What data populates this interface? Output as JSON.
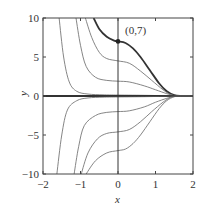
{
  "chart_data": {
    "type": "line",
    "title": "",
    "xlabel": "x",
    "ylabel": "y",
    "xlim": [
      -2,
      2
    ],
    "ylim": [
      -10,
      10
    ],
    "grid": false,
    "x_ticks": [
      "-2",
      "-1",
      "0",
      "1",
      "2"
    ],
    "y_ticks": [
      "10",
      "5",
      "0",
      "-5",
      "-10"
    ],
    "x_tick_values": [
      -2,
      -1,
      0,
      1,
      2
    ],
    "y_tick_values": [
      10,
      5,
      0,
      -5,
      -10
    ],
    "annotation": {
      "label": "(0,7)",
      "x": 0,
      "y": 7
    },
    "series": [
      {
        "name": "y(0)=7",
        "bold": true,
        "points": [
          [
            -0.65,
            10
          ],
          [
            -0.5,
            8.6
          ],
          [
            -0.3,
            7.6
          ],
          [
            -0.1,
            7.1
          ],
          [
            0,
            7
          ],
          [
            0.2,
            6.8
          ],
          [
            0.4,
            6.1
          ],
          [
            0.6,
            5
          ],
          [
            0.85,
            3.3
          ],
          [
            1.1,
            1.6
          ],
          [
            1.3,
            0.6
          ],
          [
            1.5,
            0.1
          ],
          [
            1.7,
            0
          ],
          [
            2,
            0
          ]
        ]
      },
      {
        "name": "y(0)=4.5",
        "bold": false,
        "points": [
          [
            -0.87,
            10
          ],
          [
            -0.7,
            7.5
          ],
          [
            -0.5,
            5.6
          ],
          [
            -0.3,
            4.8
          ],
          [
            0,
            4.5
          ],
          [
            0.3,
            4.2
          ],
          [
            0.6,
            3.2
          ],
          [
            0.9,
            2
          ],
          [
            1.2,
            0.8
          ],
          [
            1.4,
            0.2
          ],
          [
            1.6,
            0
          ],
          [
            2,
            0
          ]
        ]
      },
      {
        "name": "y(0)=1.9",
        "bold": false,
        "points": [
          [
            -1.12,
            10
          ],
          [
            -1.0,
            6.5
          ],
          [
            -0.85,
            3.8
          ],
          [
            -0.6,
            2.4
          ],
          [
            -0.3,
            2.0
          ],
          [
            0,
            1.9
          ],
          [
            0.3,
            1.8
          ],
          [
            0.7,
            1.3
          ],
          [
            1.0,
            0.8
          ],
          [
            1.3,
            0.3
          ],
          [
            1.5,
            0.05
          ],
          [
            1.7,
            0
          ],
          [
            2,
            0
          ]
        ]
      },
      {
        "name": "y(0)=0.2",
        "bold": false,
        "points": [
          [
            -1.57,
            10
          ],
          [
            -1.45,
            5
          ],
          [
            -1.3,
            1.8
          ],
          [
            -1.1,
            0.6
          ],
          [
            -0.8,
            0.25
          ],
          [
            -0.4,
            0.15
          ],
          [
            0,
            0.12
          ],
          [
            0.8,
            0.08
          ],
          [
            1.4,
            0.02
          ],
          [
            2,
            0
          ]
        ]
      },
      {
        "name": "y(0)=0",
        "bold": true,
        "points": [
          [
            -2,
            0
          ],
          [
            2,
            0
          ]
        ]
      },
      {
        "name": "y(0)=-0.2",
        "bold": false,
        "points": [
          [
            -1.63,
            -10
          ],
          [
            -1.5,
            -5
          ],
          [
            -1.35,
            -1.8
          ],
          [
            -1.1,
            -0.6
          ],
          [
            -0.8,
            -0.25
          ],
          [
            -0.4,
            -0.15
          ],
          [
            0,
            -0.12
          ],
          [
            0.8,
            -0.08
          ],
          [
            1.4,
            -0.02
          ],
          [
            2,
            0
          ]
        ]
      },
      {
        "name": "y(0)=-2",
        "bold": false,
        "points": [
          [
            -1.17,
            -10
          ],
          [
            -1.05,
            -6.5
          ],
          [
            -0.9,
            -3.8
          ],
          [
            -0.6,
            -2.5
          ],
          [
            -0.3,
            -2.1
          ],
          [
            0,
            -2
          ],
          [
            0.3,
            -1.9
          ],
          [
            0.7,
            -1.4
          ],
          [
            1.0,
            -0.8
          ],
          [
            1.3,
            -0.3
          ],
          [
            1.5,
            -0.05
          ],
          [
            1.7,
            0
          ],
          [
            2,
            0
          ]
        ]
      },
      {
        "name": "y(0)=-4.6",
        "bold": false,
        "points": [
          [
            -0.98,
            -10
          ],
          [
            -0.8,
            -7.3
          ],
          [
            -0.55,
            -5.5
          ],
          [
            -0.3,
            -4.8
          ],
          [
            0,
            -4.6
          ],
          [
            0.3,
            -4.3
          ],
          [
            0.6,
            -3.3
          ],
          [
            0.9,
            -2
          ],
          [
            1.2,
            -0.8
          ],
          [
            1.4,
            -0.2
          ],
          [
            1.6,
            0
          ],
          [
            2,
            0
          ]
        ]
      },
      {
        "name": "y(0)=-7",
        "bold": false,
        "points": [
          [
            -0.85,
            -10
          ],
          [
            -0.6,
            -8.3
          ],
          [
            -0.3,
            -7.3
          ],
          [
            0,
            -7
          ],
          [
            0.2,
            -6.8
          ],
          [
            0.4,
            -6.1
          ],
          [
            0.6,
            -5
          ],
          [
            0.85,
            -3.3
          ],
          [
            1.1,
            -1.6
          ],
          [
            1.3,
            -0.6
          ],
          [
            1.5,
            -0.1
          ],
          [
            1.7,
            0
          ],
          [
            2,
            0
          ]
        ]
      }
    ]
  }
}
